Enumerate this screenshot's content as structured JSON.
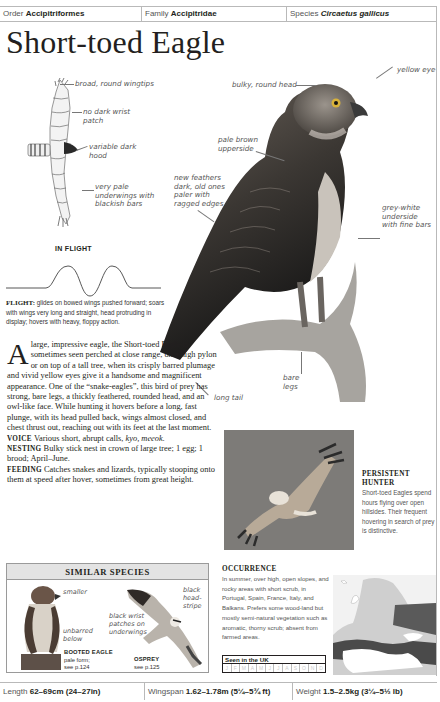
{
  "header": {
    "order_label": "Order",
    "order_value": "Accipitriformes",
    "family_label": "Family",
    "family_value": "Accipitridae",
    "species_label": "Species",
    "species_value": "Circaetus gallicus"
  },
  "title": "Short-toed Eagle",
  "flight_illustration": {
    "annotations": [
      "broad, round wingtips",
      "no dark wrist patch",
      "variable dark hood",
      "very pale underwings with blackish bars"
    ],
    "caption": "IN FLIGHT"
  },
  "flight_description": {
    "label": "FLIGHT:",
    "text": "glides on bowed wings pushed forward; soars with wings very long and straight, head protruding in display; hovers with heavy, floppy action."
  },
  "main_illustration": {
    "annotations": {
      "yellow_eye": "yellow eye",
      "head": "bulky, round head",
      "upperside": "pale brown upperside",
      "feathers": "new feathers dark, old ones paler with ragged edges",
      "underside": "grey-white underside with fine bars",
      "legs": "bare legs",
      "tail": "long tail"
    }
  },
  "body": {
    "drop_cap": "A",
    "intro": "large, impressive eagle, the Short-toed Eagle is sometimes seen perched at close range, on a high pylon or on top of a tall tree, when its crisply barred plumage and vivid yellow eyes give it a handsome and magnificent appearance. One of the “snake-eagles”, this bird of prey has strong, bare legs, a thickly feathered, rounded head, and an owl-like face. While hunting it hovers before a long, fast plunge, with its head pulled back, wings almost closed, and chest thrust out, reaching out with its feet at the last moment.",
    "voice_label": "VOICE",
    "voice_text": "Various short, abrupt calls,",
    "voice_calls": "kyo, meeok.",
    "nesting_label": "NESTING",
    "nesting_text": "Bulky stick nest in crown of large tree; 1 egg; 1 brood; April–June.",
    "feeding_label": "FEEDING",
    "feeding_text": "Catches snakes and lizards, typically stooping onto them at speed after hover, sometimes from great height."
  },
  "photo_caption": {
    "heading_line1": "PERSISTENT",
    "heading_line2": "HUNTER",
    "text": "Short-toed Eagles spend hours flying over open hillsides. Their frequent hovering in search of prey is distinctive."
  },
  "similar_species": {
    "heading": "SIMILAR SPECIES",
    "booted": {
      "notes": [
        "smaller",
        "unbarred below"
      ],
      "name": "BOOTED EAGLE",
      "detail": "pale form;",
      "ref": "see p.124"
    },
    "osprey": {
      "notes": [
        "black wrist patches on underwings",
        "black head-stripe"
      ],
      "name": "OSPREY",
      "ref": "see p.125"
    }
  },
  "occurrence": {
    "heading": "OCCURRENCE",
    "text": "In summer, over high, open slopes, and rocky areas with short scrub, in Portugal, Spain, France, Italy, and Balkans. Prefers some wood-land but mostly semi-natural vegetation such as aromatic, thorny scrub; absent from farmed areas.",
    "seen_uk_label": "Seen in the UK",
    "months": [
      "J",
      "F",
      "M",
      "A",
      "M",
      "J",
      "J",
      "A",
      "S",
      "O",
      "N",
      "D"
    ]
  },
  "footer": {
    "length_label": "Length",
    "length_value": "62–69cm (24–27in)",
    "wingspan_label": "Wingspan",
    "wingspan_value": "1.62–1.78m (5¼–5¾ ft)",
    "weight_label": "Weight",
    "weight_value": "1.5–2.5kg (3¼–5½ lb)"
  },
  "colors": {
    "rule": "#b9b9b9",
    "text": "#231f20",
    "annotation": "#555555",
    "photo_bg": "#7d7b78",
    "similar_header_bg": "#e3e3e3"
  }
}
